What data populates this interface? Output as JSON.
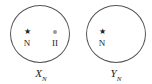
{
  "diagram": {
    "sets": [
      {
        "name": "X",
        "subscript": "N",
        "elements": [
          {
            "symbol": "★",
            "icon": "star-icon",
            "label": "N"
          },
          {
            "symbol": "●",
            "icon": "dot-icon",
            "label": "II"
          }
        ]
      },
      {
        "name": "Y",
        "subscript": "N",
        "elements": [
          {
            "symbol": "★",
            "icon": "star-icon",
            "label": "N"
          }
        ]
      }
    ]
  }
}
